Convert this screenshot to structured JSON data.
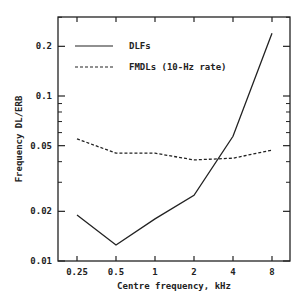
{
  "chart_data": {
    "type": "line",
    "title": "",
    "xlabel": "Centre frequency, kHz",
    "ylabel": "Frequency DL/ERB",
    "x": [
      0.25,
      0.5,
      1,
      2,
      4,
      8
    ],
    "x_tick_labels": [
      "0.25",
      "0.5",
      "1",
      "2",
      "4",
      "8"
    ],
    "y_tick_values": [
      0.01,
      0.02,
      0.05,
      0.1,
      0.2
    ],
    "y_tick_labels": [
      "0.01",
      "0.02",
      "0.05",
      "0.1",
      "0.2"
    ],
    "xscale": "log",
    "yscale": "log",
    "xlim": [
      0.19,
      11
    ],
    "ylim": [
      0.01,
      0.3
    ],
    "grid": false,
    "legend_position": "upper left",
    "series": [
      {
        "name": "DLFs",
        "style": "solid",
        "values": [
          0.019,
          0.0125,
          0.018,
          0.025,
          0.057,
          0.24
        ]
      },
      {
        "name": "FMDLs (10-Hz rate)",
        "style": "dashed",
        "values": [
          0.055,
          0.045,
          0.045,
          0.041,
          0.042,
          0.047
        ]
      }
    ]
  },
  "legend": {
    "items": [
      {
        "label": "DLFs"
      },
      {
        "label": "FMDLs (10-Hz rate)"
      }
    ]
  },
  "colors": {
    "line": "#222222",
    "background": "#ffffff"
  }
}
